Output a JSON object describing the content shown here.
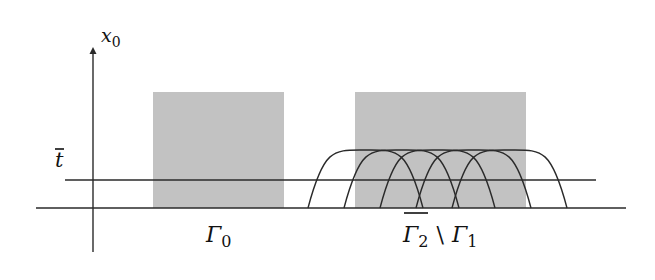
{
  "diagram": {
    "axis_label": "x",
    "axis_label_sub": "0",
    "level_label": "t",
    "colors": {
      "region_fill": "#c2c2c2",
      "line": "#2a2a2a",
      "background": "#ffffff"
    },
    "regions": [
      {
        "name": "Gamma_0",
        "label": "Γ",
        "label_sub": "0",
        "x": 153,
        "y": 92,
        "w": 131,
        "h": 116
      },
      {
        "name": "Gamma_2_bar_minus_Gamma_1",
        "label": "Γ",
        "label_sub": "2",
        "set_minus": "\\",
        "label2": "Γ",
        "label2_sub": "1",
        "x": 355,
        "y": 92,
        "w": 171,
        "h": 116
      }
    ],
    "level_line": {
      "y": 180,
      "x1": 65,
      "x2": 596
    },
    "base_line": {
      "y": 208,
      "x1": 36,
      "x2": 626
    },
    "vertical_axis": {
      "x": 93,
      "y_top": 47,
      "y_bottom": 252
    },
    "arcs": [
      {
        "x_start": 308,
        "x_end": 423,
        "peak_y": 150
      },
      {
        "x_start": 344,
        "x_end": 459,
        "peak_y": 150
      },
      {
        "x_start": 380,
        "x_end": 495,
        "peak_y": 150
      },
      {
        "x_start": 416,
        "x_end": 531,
        "peak_y": 150
      },
      {
        "x_start": 452,
        "x_end": 567,
        "peak_y": 150
      }
    ]
  }
}
